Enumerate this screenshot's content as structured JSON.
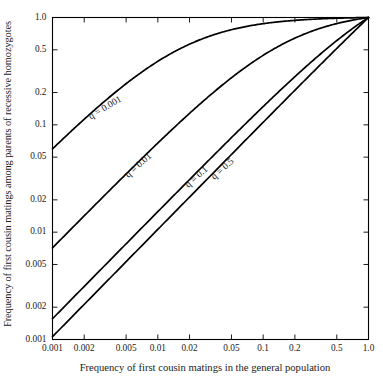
{
  "figure": {
    "title": "",
    "background_color": "#ffffff",
    "line_color": "#000000",
    "text_color": "#1a1a1a"
  },
  "axes": {
    "x_title": "Frequency of first cousin matings in the general population",
    "y_title": "Frequency of first cousin matings among parents of recessive homozygotes",
    "x_ticks": [
      "0.001",
      "0.002",
      "0.005",
      "0.01",
      "0.02",
      "0.05",
      "0.1",
      "0.2",
      "0.5",
      "1.0"
    ],
    "y_ticks": [
      "1.0",
      "0.5",
      "0.2",
      "0.1",
      "0.05",
      "0.02",
      "0.01",
      "0.005",
      "0.002",
      "0.001"
    ]
  },
  "curve_labels": [
    {
      "text": "q = 0.001"
    },
    {
      "text": "q = 0.01"
    },
    {
      "text": "q = 0.1"
    },
    {
      "text": "q = 0.5"
    }
  ],
  "chart_data": {
    "type": "line",
    "title": "",
    "xlabel": "Frequency of first cousin matings in the general population",
    "ylabel": "Frequency of first cousin matings among parents of recessive homozygotes",
    "xscale": "log",
    "yscale": "log",
    "xlim": [
      0.001,
      1.0
    ],
    "ylim": [
      0.001,
      1.0
    ],
    "xticks": [
      0.001,
      0.002,
      0.005,
      0.01,
      0.02,
      0.05,
      0.1,
      0.2,
      0.5,
      1.0
    ],
    "yticks": [
      0.001,
      0.002,
      0.005,
      0.01,
      0.02,
      0.05,
      0.1,
      0.2,
      0.5,
      1.0
    ],
    "grid": false,
    "legend": "inline-curve-labels",
    "series": [
      {
        "name": "q = 0.001",
        "q": 0.001,
        "x": [
          0.001,
          0.002,
          0.005,
          0.01,
          0.02,
          0.05,
          0.1,
          0.2,
          0.5,
          1.0
        ],
        "y": [
          0.0649,
          0.1224,
          0.2604,
          0.4136,
          0.5858,
          0.8048,
          0.892,
          0.9428,
          0.9769,
          1.0
        ]
      },
      {
        "name": "q = 0.01",
        "q": 0.01,
        "x": [
          0.001,
          0.002,
          0.005,
          0.01,
          0.02,
          0.05,
          0.1,
          0.2,
          0.5,
          1.0
        ],
        "y": [
          0.0077,
          0.0154,
          0.038,
          0.0744,
          0.1434,
          0.3129,
          0.4902,
          0.6724,
          0.8695,
          1.0
        ]
      },
      {
        "name": "q = 0.1",
        "q": 0.1,
        "x": [
          0.001,
          0.002,
          0.005,
          0.01,
          0.02,
          0.05,
          0.1,
          0.2,
          0.5,
          1.0
        ],
        "y": [
          0.00166,
          0.00333,
          0.00832,
          0.01663,
          0.0332,
          0.08246,
          0.16329,
          0.32069,
          0.7619,
          1.0
        ]
      },
      {
        "name": "q = 0.5",
        "q": 0.5,
        "x": [
          0.001,
          0.002,
          0.005,
          0.01,
          0.02,
          0.05,
          0.1,
          0.2,
          0.5,
          1.0
        ],
        "y": [
          0.00106,
          0.00212,
          0.00531,
          0.01061,
          0.02123,
          0.05306,
          0.10612,
          0.21223,
          0.53057,
          1.0
        ]
      }
    ]
  }
}
